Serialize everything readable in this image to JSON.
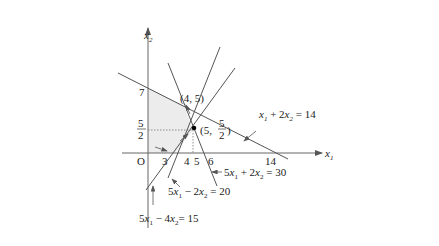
{
  "diagram": {
    "type": "linear-programming-feasible-region",
    "axes": {
      "x_label": "x1",
      "y_label": "x2",
      "origin_label": "O"
    },
    "x_ticks": [
      "3",
      "4",
      "5",
      "6",
      "14"
    ],
    "y_ticks": [
      "7",
      "5/2"
    ],
    "points": [
      {
        "label": "(4, 5)",
        "x": 4,
        "y": 5
      },
      {
        "label": "(5, 5/2)",
        "x": 5,
        "y": 2.5,
        "marked": true
      }
    ],
    "lines": [
      {
        "equation": "x1 + 2x2 = 14",
        "x_intercept": 14,
        "y_intercept": 7
      },
      {
        "equation": "5x1 + 2x2 = 30",
        "x_intercept": 6,
        "y_intercept": 15
      },
      {
        "equation": "5x1 - 2x2 = 20",
        "x_intercept": 4
      },
      {
        "equation": "5x1 - 4x2 = 15",
        "x_intercept": 3
      }
    ],
    "labels": {
      "line1": "x1 + 2x2 = 14",
      "line2": "5x1 + 2x2 = 30",
      "line3": "5x1 - 2x2 = 20",
      "line4": "5x1 - 4x2 = 15"
    },
    "colors": {
      "feasible_fill": "#ececec",
      "line": "#555555",
      "axis": "#666666"
    }
  }
}
